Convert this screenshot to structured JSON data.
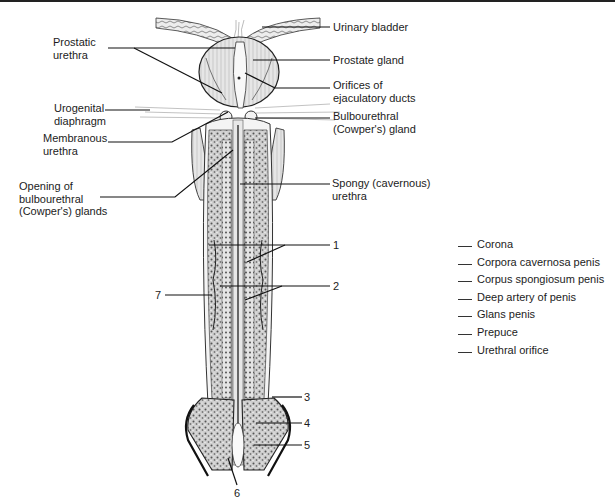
{
  "figure": {
    "labels": {
      "urinary_bladder": "Urinary bladder",
      "prostatic_urethra": [
        "Prostatic",
        "urethra"
      ],
      "prostate_gland": "Prostate gland",
      "orifices_ejaculatory": [
        "Orifices of",
        "ejaculatory ducts"
      ],
      "urogenital_diaphragm": [
        "Urogenital",
        "diaphragm"
      ],
      "bulbourethral_gland": [
        "Bulbourethral",
        "(Cowper's) gland"
      ],
      "membranous_urethra": [
        "Membranous",
        "urethra"
      ],
      "opening_bulbourethral": [
        "Opening of",
        "bulbourethral",
        "(Cowper's) glands"
      ],
      "spongy_urethra": [
        "Spongy (cavernous)",
        "urethra"
      ]
    },
    "numbers": [
      "1",
      "2",
      "3",
      "4",
      "5",
      "6",
      "7"
    ],
    "answer_key": [
      "Corona",
      "Corpora cavernosa penis",
      "Corpus spongiosum penis",
      "Deep artery of penis",
      "Glans penis",
      "Prepuce",
      "Urethral orifice"
    ]
  }
}
